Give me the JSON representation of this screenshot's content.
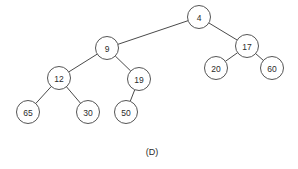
{
  "figure": {
    "caption": "(D)",
    "caption_x": 152,
    "caption_y": 152,
    "background_color": "#ffffff",
    "node_fill": "#ffffff",
    "node_stroke": "#555555",
    "edge_color": "#4a4a4a",
    "label_color": "#2b2b2b"
  },
  "chart_data": {
    "type": "diagram",
    "diagram_kind": "binary-tree",
    "title": "(D)",
    "root": "4",
    "nodes": [
      {
        "id": "n4",
        "label": "4",
        "x": 199,
        "y": 17,
        "r": 11.5,
        "depth": 0
      },
      {
        "id": "n9",
        "label": "9",
        "x": 107,
        "y": 48,
        "r": 11.5,
        "depth": 1
      },
      {
        "id": "n17",
        "label": "17",
        "x": 247,
        "y": 46,
        "r": 11.5,
        "depth": 1
      },
      {
        "id": "n12",
        "label": "12",
        "x": 59,
        "y": 78,
        "r": 11.5,
        "depth": 2
      },
      {
        "id": "n19",
        "label": "19",
        "x": 139,
        "y": 79,
        "r": 11.5,
        "depth": 2
      },
      {
        "id": "n20",
        "label": "20",
        "x": 216,
        "y": 68,
        "r": 11.5,
        "depth": 2
      },
      {
        "id": "n60",
        "label": "60",
        "x": 272,
        "y": 68,
        "r": 11.5,
        "depth": 2
      },
      {
        "id": "n65",
        "label": "65",
        "x": 28,
        "y": 112,
        "r": 11.5,
        "depth": 3
      },
      {
        "id": "n30",
        "label": "30",
        "x": 88,
        "y": 112,
        "r": 11.5,
        "depth": 3
      },
      {
        "id": "n50",
        "label": "50",
        "x": 126,
        "y": 112,
        "r": 11.5,
        "depth": 3
      }
    ],
    "edges": [
      {
        "from": "n4",
        "to": "n9",
        "side": "left"
      },
      {
        "from": "n4",
        "to": "n17",
        "side": "right"
      },
      {
        "from": "n9",
        "to": "n12",
        "side": "left"
      },
      {
        "from": "n9",
        "to": "n19",
        "side": "right"
      },
      {
        "from": "n17",
        "to": "n20",
        "side": "left"
      },
      {
        "from": "n17",
        "to": "n60",
        "side": "right"
      },
      {
        "from": "n12",
        "to": "n65",
        "side": "left"
      },
      {
        "from": "n12",
        "to": "n30",
        "side": "right"
      },
      {
        "from": "n19",
        "to": "n50",
        "side": "left"
      }
    ]
  }
}
